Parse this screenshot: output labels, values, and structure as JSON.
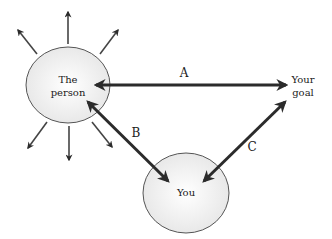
{
  "diagram": {
    "nodes": {
      "person": {
        "line1": "The",
        "line2": "person"
      },
      "you": {
        "label": "You"
      },
      "goal": {
        "line1": "Your",
        "line2": "goal"
      }
    },
    "edges": {
      "a": {
        "label": "A",
        "from": "The person",
        "to": "Your goal",
        "direction": "both"
      },
      "b": {
        "label": "B",
        "from": "The person",
        "to": "You",
        "direction": "both"
      },
      "c": {
        "label": "C",
        "from": "You",
        "to": "Your goal",
        "direction": "both"
      }
    },
    "radiating_arrows_count": 8,
    "colors": {
      "ellipse_fill": "#f2f2f2",
      "ellipse_stroke": "#555555",
      "arrow": "#2b2b2b"
    }
  }
}
